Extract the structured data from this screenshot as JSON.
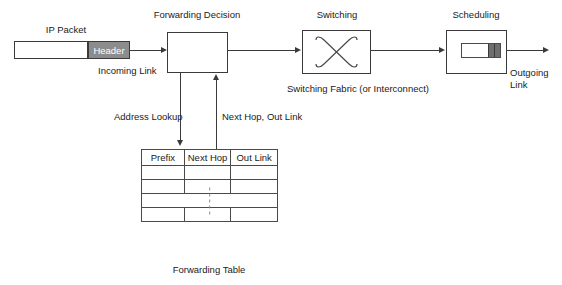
{
  "diagram": {
    "title_cut": "",
    "nodes": {
      "ip_packet_label": "IP Packet",
      "packet_header_label": "Header",
      "forwarding_decision_label": "Forwarding Decision",
      "switching_label": "Switching",
      "scheduling_label": "Scheduling",
      "switching_fabric_caption": "Switching Fabric (or Interconnect)",
      "forwarding_table_caption": "Forwarding Table"
    },
    "edges": {
      "incoming_link_label": "Incoming Link",
      "address_lookup_label": "Address Lookup",
      "next_hop_out_link_label": "Next Hop, Out Link",
      "outgoing_link_line1": "Outgoing",
      "outgoing_link_line2": "Link"
    },
    "table": {
      "headers": [
        "Prefix",
        "Next Hop",
        "Out Link"
      ],
      "rows": [
        [
          "",
          "",
          ""
        ],
        [
          "",
          "",
          ""
        ],
        [
          "",
          "",
          ""
        ]
      ],
      "ellipsis": "vertical-dots"
    },
    "colors": {
      "stroke": "#3a3a3a",
      "header_fill": "#8c8c8c",
      "queue_fill": "#6e6e6e",
      "background": "#ffffff",
      "text": "#1a1a1a"
    }
  }
}
